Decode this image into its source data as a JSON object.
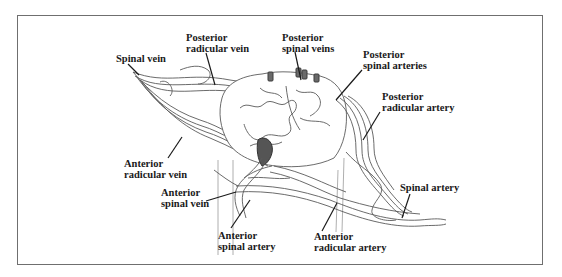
{
  "figure": {
    "border_color": "#6f6f6f",
    "line_color": "#1a1a1a",
    "vessel_color": "#5a5a5a",
    "labels": [
      {
        "id": "spinal-vein",
        "line1": "Spinal vein",
        "line2": ""
      },
      {
        "id": "posterior-radicular-vein",
        "line1": "Posterior",
        "line2": "radicular vein"
      },
      {
        "id": "posterior-spinal-veins",
        "line1": "Posterior",
        "line2": "spinal veins"
      },
      {
        "id": "posterior-spinal-arteries",
        "line1": "Posterior",
        "line2": "spinal arteries"
      },
      {
        "id": "posterior-radicular-artery",
        "line1": "Posterior",
        "line2": "radicular artery"
      },
      {
        "id": "anterior-radicular-vein",
        "line1": "Anterior",
        "line2": "radicular vein"
      },
      {
        "id": "anterior-spinal-vein",
        "line1": "Anterior",
        "line2": "spinal vein"
      },
      {
        "id": "anterior-spinal-artery",
        "line1": "Anterior",
        "line2": "spinal artery"
      },
      {
        "id": "anterior-radicular-artery",
        "line1": "Anterior",
        "line2": "radicular artery"
      },
      {
        "id": "spinal-artery",
        "line1": "Spinal artery",
        "line2": ""
      }
    ]
  }
}
